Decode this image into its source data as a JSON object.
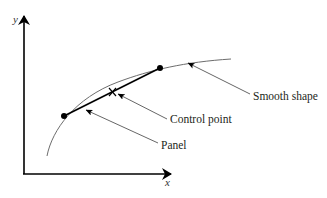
{
  "diagram": {
    "axes": {
      "x_label": "x",
      "y_label": "y"
    },
    "labels": {
      "smooth_shape": "Smooth shape",
      "control_point": "Control point",
      "panel": "Panel"
    },
    "markers": {
      "control_point_symbol": "X"
    },
    "colors": {
      "ink": "#000000",
      "curve": "#6d6d6d",
      "leader": "#555555",
      "text": "#231f20"
    }
  }
}
